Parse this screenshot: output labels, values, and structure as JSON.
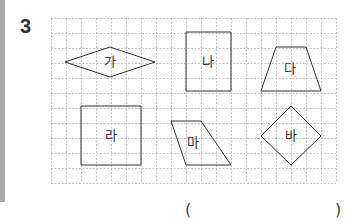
{
  "question": {
    "number": "3"
  },
  "grid": {
    "x": 51,
    "y": 18,
    "cell": 15,
    "cols": 19,
    "rows": 11,
    "line_color": "#b8b8b8"
  },
  "shapes": [
    {
      "label": "가",
      "type": "rhombus",
      "points": "65,62 110,47 155,62 110,77",
      "label_pos": [
        110,
        66
      ]
    },
    {
      "label": "나",
      "type": "rectangle",
      "points": "186,32 231,32 231,91 186,91",
      "label_pos": [
        208,
        66
      ]
    },
    {
      "label": "다",
      "type": "trapezoid",
      "points": "276,47 306,47 321,91 261,91",
      "label_pos": [
        290,
        73
      ]
    },
    {
      "label": "라",
      "type": "square",
      "points": "81,106 141,106 141,165 81,165",
      "label_pos": [
        111,
        140
      ]
    },
    {
      "label": "마",
      "type": "parallelogram",
      "points": "171,121 201,121 231,165 186,165",
      "label_pos": [
        193,
        147
      ]
    },
    {
      "label": "바",
      "type": "square-rotated",
      "points": "291,106 321,136 291,165 261,136",
      "label_pos": [
        291,
        140
      ]
    }
  ],
  "answer": {
    "open_paren": "(",
    "close_paren": ")"
  }
}
